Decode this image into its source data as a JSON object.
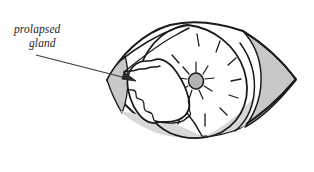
{
  "figure": {
    "type": "anatomical-line-drawing",
    "background_color": "#ffffff",
    "ink_color": "#1a1a1a",
    "shade_color": "#c8c8c8",
    "light_shade_color": "#d8d8d8",
    "pupil_color": "#b4b4b4",
    "canvas": {
      "width": 314,
      "height": 172
    }
  },
  "annotation": {
    "label_line1": "prolapsed",
    "label_line2": "gland",
    "leader_start_x": 36,
    "leader_start_y": 55,
    "leader_end_x": 133,
    "leader_end_y": 80,
    "arrowhead": "solid-triangle"
  },
  "parts": {
    "globe_label": "eyeball-outline",
    "upper_lid_label": "upper-eyelid",
    "lower_lid_label": "lower-eyelid",
    "medial_canthus_label": "medial-canthus-shaded",
    "lateral_canthus_label": "lateral-canthus-shaded",
    "cornea_label": "cornea",
    "pupil_label": "pupil",
    "gland_label": "prolapsed-gland-mass",
    "highlight_label": "corneal-highlight-rays"
  }
}
